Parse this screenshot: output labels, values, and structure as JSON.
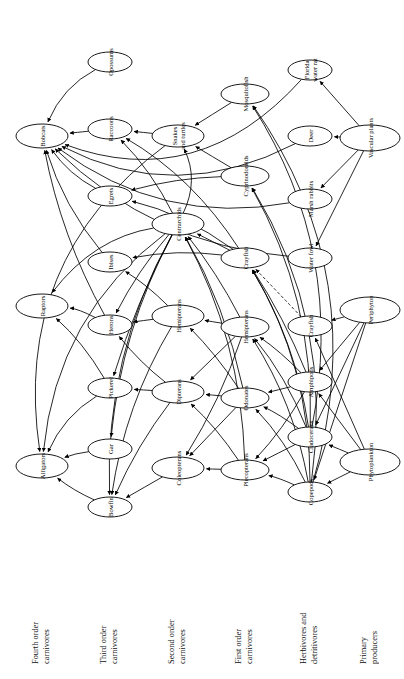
{
  "figure": {
    "kind": "food-web-diagram",
    "orientation": "rotated-90-ccw",
    "background": "#ffffff",
    "stroke_color": "#000000",
    "node_fill": "#ffffff"
  },
  "trophic_levels": [
    {
      "id": "t4",
      "label": "Fourth order\ncarnivores",
      "column_x": 42
    },
    {
      "id": "t3",
      "label": "Third order\ncarnivores",
      "column_x": 110
    },
    {
      "id": "t2",
      "label": "Second order\ncarnivores",
      "column_x": 178
    },
    {
      "id": "t1",
      "label": "First order\ncarnivores",
      "column_x": 245
    },
    {
      "id": "hd",
      "label": "Herbivores and\ndetritivores",
      "column_x": 310
    },
    {
      "id": "pp",
      "label": "Primary\nproducers",
      "column_x": 370
    }
  ],
  "nodes": [
    {
      "id": "bobcats",
      "label": "Bobcats",
      "level": "t4",
      "x": 42,
      "y": 136,
      "rx": 26,
      "ry": 12
    },
    {
      "id": "raptors",
      "label": "Raptors",
      "level": "t4",
      "x": 42,
      "y": 306,
      "rx": 26,
      "ry": 12
    },
    {
      "id": "alligators",
      "label": "Alligators",
      "level": "t4",
      "x": 42,
      "y": 466,
      "rx": 26,
      "ry": 12
    },
    {
      "id": "opossums",
      "label": "Opossums",
      "level": "t3",
      "x": 110,
      "y": 62,
      "rx": 22,
      "ry": 10
    },
    {
      "id": "raccoons",
      "label": "Raccoons",
      "level": "t3",
      "x": 110,
      "y": 129,
      "rx": 22,
      "ry": 10
    },
    {
      "id": "egrets",
      "label": "Egrets",
      "level": "t3",
      "x": 110,
      "y": 196,
      "rx": 22,
      "ry": 10
    },
    {
      "id": "ibises",
      "label": "Ibises",
      "level": "t3",
      "x": 110,
      "y": 262,
      "rx": 22,
      "ry": 10
    },
    {
      "id": "herons",
      "label": "Herons",
      "level": "t3",
      "x": 110,
      "y": 325,
      "rx": 22,
      "ry": 10
    },
    {
      "id": "pickerel",
      "label": "Pickerel",
      "level": "t3",
      "x": 110,
      "y": 388,
      "rx": 22,
      "ry": 10
    },
    {
      "id": "gar",
      "label": "Gar",
      "level": "t3",
      "x": 110,
      "y": 449,
      "rx": 22,
      "ry": 10
    },
    {
      "id": "bowfin",
      "label": "Bowfin",
      "level": "t3",
      "x": 110,
      "y": 507,
      "rx": 22,
      "ry": 10
    },
    {
      "id": "snakes",
      "label": "Snakes\nand turtles",
      "level": "t2",
      "x": 178,
      "y": 136,
      "rx": 26,
      "ry": 11
    },
    {
      "id": "centrarchids",
      "label": "Centrarchids",
      "level": "t2",
      "x": 178,
      "y": 224,
      "rx": 26,
      "ry": 11
    },
    {
      "id": "hemipterans2",
      "label": "Hemipterans",
      "level": "t2",
      "x": 178,
      "y": 316,
      "rx": 26,
      "ry": 11
    },
    {
      "id": "dipterans",
      "label": "Dipterans",
      "level": "t2",
      "x": 178,
      "y": 392,
      "rx": 26,
      "ry": 11
    },
    {
      "id": "coleopterans",
      "label": "Coleopterans",
      "level": "t2",
      "x": 178,
      "y": 468,
      "rx": 26,
      "ry": 11
    },
    {
      "id": "mosquitofish",
      "label": "Mosquitofish",
      "level": "t1",
      "x": 245,
      "y": 94,
      "rx": 24,
      "ry": 10
    },
    {
      "id": "cyprinodontids",
      "label": "Cyprinodontids",
      "level": "t1",
      "x": 245,
      "y": 176,
      "rx": 24,
      "ry": 10
    },
    {
      "id": "crayfish1",
      "label": "Crayfish",
      "level": "t1",
      "x": 245,
      "y": 258,
      "rx": 24,
      "ry": 10
    },
    {
      "id": "hemipterans1",
      "label": "Hemipterans",
      "level": "t1",
      "x": 245,
      "y": 327,
      "rx": 24,
      "ry": 10
    },
    {
      "id": "odonates",
      "label": "Odonates",
      "level": "t1",
      "x": 245,
      "y": 398,
      "rx": 24,
      "ry": 10
    },
    {
      "id": "plecopterans",
      "label": "Plecopterans",
      "level": "t1",
      "x": 245,
      "y": 470,
      "rx": 24,
      "ry": 10
    },
    {
      "id": "floridarat",
      "label": "Florida\nwater rat",
      "level": "hd",
      "x": 310,
      "y": 70,
      "rx": 22,
      "ry": 10
    },
    {
      "id": "deer",
      "label": "Deer",
      "level": "hd",
      "x": 310,
      "y": 136,
      "rx": 22,
      "ry": 10
    },
    {
      "id": "marshrabbits",
      "label": "Marsh rabbits",
      "level": "hd",
      "x": 310,
      "y": 199,
      "rx": 22,
      "ry": 10
    },
    {
      "id": "waterfowl",
      "label": "Water fowl",
      "level": "hd",
      "x": 310,
      "y": 258,
      "rx": 22,
      "ry": 10
    },
    {
      "id": "crayfish2",
      "label": "Crayfish",
      "level": "hd",
      "x": 310,
      "y": 326,
      "rx": 22,
      "ry": 10
    },
    {
      "id": "amphipods",
      "label": "Amphipods",
      "level": "hd",
      "x": 310,
      "y": 382,
      "rx": 22,
      "ry": 10
    },
    {
      "id": "cladocerans",
      "label": "Cladocerans",
      "level": "hd",
      "x": 310,
      "y": 437,
      "rx": 22,
      "ry": 10
    },
    {
      "id": "copepods",
      "label": "Copepods",
      "level": "hd",
      "x": 310,
      "y": 492,
      "rx": 22,
      "ry": 10
    },
    {
      "id": "vascular",
      "label": "Vascular plants",
      "level": "pp",
      "x": 370,
      "y": 138,
      "rx": 30,
      "ry": 13
    },
    {
      "id": "periphyton",
      "label": "Periphyton",
      "level": "pp",
      "x": 370,
      "y": 310,
      "rx": 30,
      "ry": 13
    },
    {
      "id": "phytoplankton",
      "label": "Phytoplankton",
      "level": "pp",
      "x": 370,
      "y": 462,
      "rx": 30,
      "ry": 13
    }
  ],
  "edges": [
    {
      "from": "opossums",
      "to": "bobcats",
      "style": "solid",
      "curve": 0.18
    },
    {
      "from": "raccoons",
      "to": "bobcats",
      "style": "solid",
      "curve": 0
    },
    {
      "from": "egrets",
      "to": "bobcats",
      "style": "solid",
      "curve": -0.12
    },
    {
      "from": "ibises",
      "to": "bobcats",
      "style": "solid",
      "curve": -0.1
    },
    {
      "from": "herons",
      "to": "bobcats",
      "style": "solid",
      "curve": -0.08
    },
    {
      "from": "floridarat",
      "to": "bobcats",
      "style": "solid",
      "curve": -0.34
    },
    {
      "from": "marshrabbits",
      "to": "bobcats",
      "style": "solid",
      "curve": -0.22
    },
    {
      "from": "deer",
      "to": "bobcats",
      "style": "solid",
      "curve": -0.26
    },
    {
      "from": "waterfowl",
      "to": "bobcats",
      "style": "solid",
      "curve": -0.18
    },
    {
      "from": "herons",
      "to": "raptors",
      "style": "solid",
      "curve": 0.1
    },
    {
      "from": "pickerel",
      "to": "raptors",
      "style": "solid",
      "curve": 0.08
    },
    {
      "from": "centrarchids",
      "to": "raptors",
      "style": "solid",
      "curve": 0.2
    },
    {
      "from": "pickerel",
      "to": "alligators",
      "style": "solid",
      "curve": 0.16
    },
    {
      "from": "gar",
      "to": "alligators",
      "style": "solid",
      "curve": 0.06
    },
    {
      "from": "bowfin",
      "to": "alligators",
      "style": "solid",
      "curve": -0.06
    },
    {
      "from": "centrarchids",
      "to": "alligators",
      "style": "solid",
      "curve": 0.22
    },
    {
      "from": "snakes",
      "to": "alligators",
      "style": "solid",
      "curve": 0.3
    },
    {
      "from": "snakes",
      "to": "raccoons",
      "style": "solid",
      "curve": 0
    },
    {
      "from": "centrarchids",
      "to": "raccoons",
      "style": "solid",
      "curve": 0.08
    },
    {
      "from": "crayfish1",
      "to": "raccoons",
      "style": "solid",
      "curve": 0.12
    },
    {
      "from": "crayfish1",
      "to": "egrets",
      "style": "solid",
      "curve": 0.1
    },
    {
      "from": "cyprinodontids",
      "to": "egrets",
      "style": "solid",
      "curve": 0.06
    },
    {
      "from": "mosquitofish",
      "to": "snakes",
      "style": "solid",
      "curve": 0
    },
    {
      "from": "cyprinodontids",
      "to": "snakes",
      "style": "solid",
      "curve": 0
    },
    {
      "from": "centrarchids",
      "to": "snakes",
      "style": "solid",
      "curve": 0.24
    },
    {
      "from": "crayfish1",
      "to": "ibises",
      "style": "solid",
      "curve": 0.08
    },
    {
      "from": "hemipterans2",
      "to": "ibises",
      "style": "solid",
      "curve": 0.06
    },
    {
      "from": "centrarchids",
      "to": "herons",
      "style": "solid",
      "curve": 0.06
    },
    {
      "from": "hemipterans2",
      "to": "herons",
      "style": "solid",
      "curve": 0
    },
    {
      "from": "dipterans",
      "to": "herons",
      "style": "solid",
      "curve": -0.06
    },
    {
      "from": "centrarchids",
      "to": "pickerel",
      "style": "solid",
      "curve": 0.05
    },
    {
      "from": "dipterans",
      "to": "pickerel",
      "style": "solid",
      "curve": 0
    },
    {
      "from": "centrarchids",
      "to": "gar",
      "style": "solid",
      "curve": 0.1
    },
    {
      "from": "centrarchids",
      "to": "bowfin",
      "style": "solid",
      "curve": 0.14
    },
    {
      "from": "hemipterans2",
      "to": "bowfin",
      "style": "solid",
      "curve": 0.1
    },
    {
      "from": "dipterans",
      "to": "bowfin",
      "style": "solid",
      "curve": 0.06
    },
    {
      "from": "coleopterans",
      "to": "bowfin",
      "style": "solid",
      "curve": 0
    },
    {
      "from": "crayfish1",
      "to": "centrarchids",
      "style": "solid",
      "curve": 0
    },
    {
      "from": "hemipterans1",
      "to": "centrarchids",
      "style": "solid",
      "curve": 0.05
    },
    {
      "from": "odonates",
      "to": "centrarchids",
      "style": "solid",
      "curve": 0.08
    },
    {
      "from": "plecopterans",
      "to": "centrarchids",
      "style": "solid",
      "curve": 0.12
    },
    {
      "from": "hemipterans1",
      "to": "hemipterans2",
      "style": "solid",
      "curve": 0
    },
    {
      "from": "odonates",
      "to": "hemipterans2",
      "style": "solid",
      "curve": 0.05
    },
    {
      "from": "hemipterans1",
      "to": "dipterans",
      "style": "solid",
      "curve": 0
    },
    {
      "from": "odonates",
      "to": "dipterans",
      "style": "solid",
      "curve": 0
    },
    {
      "from": "plecopterans",
      "to": "dipterans",
      "style": "solid",
      "curve": 0.06
    },
    {
      "from": "odonates",
      "to": "coleopterans",
      "style": "solid",
      "curve": 0
    },
    {
      "from": "plecopterans",
      "to": "coleopterans",
      "style": "solid",
      "curve": 0
    },
    {
      "from": "hemipterans1",
      "to": "coleopterans",
      "style": "solid",
      "curve": -0.06
    },
    {
      "from": "crayfish2",
      "to": "crayfish1",
      "style": "dashed",
      "curve": 0
    },
    {
      "from": "amphipods",
      "to": "crayfish1",
      "style": "solid",
      "curve": 0.05
    },
    {
      "from": "cladocerans",
      "to": "crayfish1",
      "style": "solid",
      "curve": 0.1
    },
    {
      "from": "copepods",
      "to": "crayfish1",
      "style": "solid",
      "curve": 0.14
    },
    {
      "from": "cladocerans",
      "to": "mosquitofish",
      "style": "solid",
      "curve": 0.2
    },
    {
      "from": "copepods",
      "to": "mosquitofish",
      "style": "solid",
      "curve": 0.24
    },
    {
      "from": "cladocerans",
      "to": "cyprinodontids",
      "style": "solid",
      "curve": 0.14
    },
    {
      "from": "copepods",
      "to": "cyprinodontids",
      "style": "solid",
      "curve": 0.18
    },
    {
      "from": "amphipods",
      "to": "hemipterans1",
      "style": "solid",
      "curve": 0.05
    },
    {
      "from": "cladocerans",
      "to": "hemipterans1",
      "style": "solid",
      "curve": 0.08
    },
    {
      "from": "copepods",
      "to": "hemipterans1",
      "style": "solid",
      "curve": 0.1
    },
    {
      "from": "amphipods",
      "to": "odonates",
      "style": "solid",
      "curve": 0
    },
    {
      "from": "cladocerans",
      "to": "odonates",
      "style": "solid",
      "curve": 0.05
    },
    {
      "from": "copepods",
      "to": "odonates",
      "style": "solid",
      "curve": 0.08
    },
    {
      "from": "amphipods",
      "to": "plecopterans",
      "style": "solid",
      "curve": -0.06
    },
    {
      "from": "cladocerans",
      "to": "plecopterans",
      "style": "solid",
      "curve": 0
    },
    {
      "from": "copepods",
      "to": "plecopterans",
      "style": "solid",
      "curve": 0.05
    },
    {
      "from": "vascular",
      "to": "floridarat",
      "style": "solid",
      "curve": 0
    },
    {
      "from": "vascular",
      "to": "deer",
      "style": "solid",
      "curve": 0
    },
    {
      "from": "vascular",
      "to": "marshrabbits",
      "style": "solid",
      "curve": 0
    },
    {
      "from": "vascular",
      "to": "waterfowl",
      "style": "solid",
      "curve": 0
    },
    {
      "from": "periphyton",
      "to": "crayfish2",
      "style": "solid",
      "curve": 0
    },
    {
      "from": "periphyton",
      "to": "amphipods",
      "style": "solid",
      "curve": 0
    },
    {
      "from": "periphyton",
      "to": "cladocerans",
      "style": "solid",
      "curve": 0
    },
    {
      "from": "periphyton",
      "to": "copepods",
      "style": "solid",
      "curve": 0
    },
    {
      "from": "phytoplankton",
      "to": "crayfish2",
      "style": "solid",
      "curve": 0
    },
    {
      "from": "phytoplankton",
      "to": "amphipods",
      "style": "solid",
      "curve": 0
    },
    {
      "from": "phytoplankton",
      "to": "cladocerans",
      "style": "solid",
      "curve": 0
    },
    {
      "from": "phytoplankton",
      "to": "copepods",
      "style": "solid",
      "curve": 0
    }
  ]
}
